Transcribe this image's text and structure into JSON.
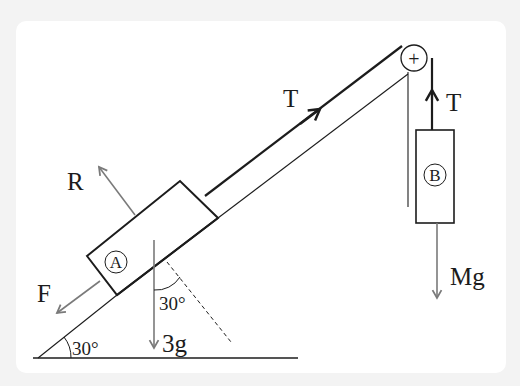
{
  "diagram": {
    "title": "",
    "incline_angle_label": "30°",
    "weight_angle_label": "30°",
    "labels": {
      "tension_incline": "T",
      "tension_hanging": "T",
      "normal_reaction": "R",
      "friction": "F",
      "weight_a": "3g",
      "weight_b": "Mg",
      "block_a": "A",
      "block_b": "B",
      "pulley_symbol": "+"
    },
    "colors": {
      "line": "#1c1c1c",
      "force_arrow": "#7a7a7a",
      "background_outer": "#f3f3f3",
      "background_inner": "#ffffff"
    }
  }
}
